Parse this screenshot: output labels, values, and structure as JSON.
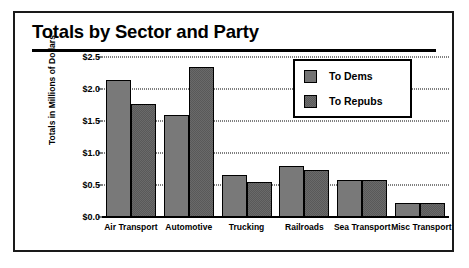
{
  "chart_data": {
    "type": "bar",
    "title": "Totals by Sector and Party",
    "xlabel": "",
    "ylabel": "Totals in Millions of Dollars",
    "ylim": [
      0.0,
      2.5
    ],
    "ytick_values": [
      0.0,
      0.5,
      1.0,
      1.5,
      2.0,
      2.5
    ],
    "ytick_labels": [
      "$0.0",
      "$0.5",
      "$1.0",
      "$1.5",
      "$2.0",
      "$2.5"
    ],
    "grid": true,
    "legend_position": "upper right",
    "categories": [
      "Air Transport",
      "Automotive",
      "Trucking",
      "Railroads",
      "Sea Transport",
      "Misc Transport"
    ],
    "series": [
      {
        "name": "To Dems",
        "color": "#c9c9c9",
        "values": [
          2.14,
          1.6,
          0.66,
          0.8,
          0.58,
          0.22
        ]
      },
      {
        "name": "To Repubs",
        "color": "#2a2a2a",
        "values": [
          1.77,
          2.35,
          0.55,
          0.73,
          0.58,
          0.22
        ]
      }
    ]
  },
  "legend": {
    "entries": [
      {
        "label": "To Dems"
      },
      {
        "label": "To Repubs"
      }
    ]
  }
}
